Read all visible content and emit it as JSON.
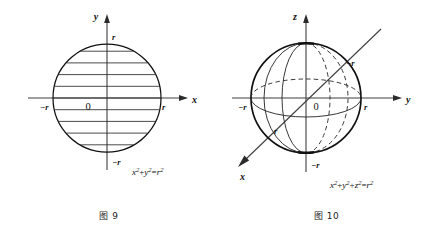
{
  "figures": [
    {
      "id": "figure-9",
      "caption": "图 9",
      "kind": "circle-with-horizontal-chords",
      "axes": [
        {
          "name": "x-axis",
          "label": "x",
          "orientation": "horizontal",
          "arrow": "right"
        },
        {
          "name": "y-axis",
          "label": "y",
          "orientation": "vertical",
          "arrow": "up"
        }
      ],
      "ticks": {
        "x_negative": "−r",
        "x_positive": "r",
        "y_positive": "r",
        "y_negative": "−r"
      },
      "origin": "0",
      "equation": {
        "full": "x²+y²=r²",
        "terms": [
          {
            "base": "x",
            "exp": "2"
          },
          {
            "op": "+"
          },
          {
            "base": "y",
            "exp": "2"
          },
          {
            "op": "="
          },
          {
            "base": "r",
            "exp": "2"
          }
        ]
      },
      "chord_count": 9
    },
    {
      "id": "figure-10",
      "caption": "图 10",
      "kind": "sphere-with-great-circles",
      "axes": [
        {
          "name": "x-axis",
          "label": "x",
          "orientation": "diagonal-down-left",
          "arrow": "down-left"
        },
        {
          "name": "y-axis",
          "label": "y",
          "orientation": "horizontal",
          "arrow": "right"
        },
        {
          "name": "z-axis",
          "label": "z",
          "orientation": "vertical",
          "arrow": "up"
        }
      ],
      "ticks": {
        "y_negative": "−r",
        "y_positive": "r",
        "z_positive_hidden": "",
        "z_negative": "−r",
        "x_positive": "r",
        "x_negative": "−r"
      },
      "origin": "0",
      "equation": {
        "full": "x²+y²+z²=r²",
        "terms": [
          {
            "base": "x",
            "exp": "2"
          },
          {
            "op": "+"
          },
          {
            "base": "y",
            "exp": "2"
          },
          {
            "op": "+"
          },
          {
            "base": "z",
            "exp": "2"
          },
          {
            "op": "="
          },
          {
            "base": "r",
            "exp": "2"
          }
        ]
      }
    }
  ],
  "colors": {
    "background": "#ffffff",
    "stroke": "#111111",
    "axis_stroke": "#3a3a3a",
    "chord_stroke": "#2a2a2a"
  }
}
